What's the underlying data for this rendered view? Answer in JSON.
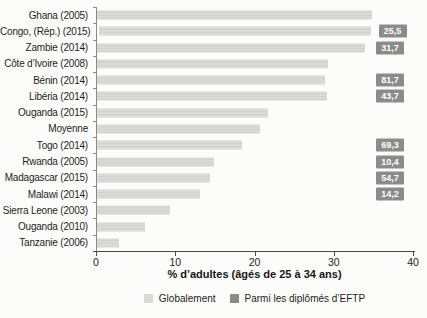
{
  "chart_data": {
    "type": "bar",
    "orientation": "horizontal",
    "title": "",
    "xlabel": "% d’adultes (âgés de 25 à 34 ans)",
    "xlim": [
      0,
      40
    ],
    "xticks": [
      0,
      10,
      20,
      30,
      40
    ],
    "xtick_labels": [
      "0",
      "10",
      "20",
      "30",
      "40"
    ],
    "grid": false,
    "legend_position": "bottom-center",
    "categories": [
      "Ghana (2005)",
      "Congo, (Rép.) (2015)",
      "Zambie (2014)",
      "Côte d’Ivoire (2008)",
      "Bénin (2014)",
      "Libéria (2014)",
      "Ouganda (2015)",
      "Moyenne",
      "Togo (2014)",
      "Rwanda (2005)",
      "Madagascar (2015)",
      "Malawi (2014)",
      "Sierra Leone (2003)",
      "Ouganda (2010)",
      "Tanzanie (2006)"
    ],
    "series": [
      {
        "name": "Globalement",
        "display": "bar",
        "color": "#d9d9d6",
        "values": [
          34.8,
          34.4,
          33.9,
          29.3,
          28.9,
          29.1,
          21.7,
          20.7,
          18.4,
          14.9,
          14.4,
          13.1,
          9.3,
          6.2,
          2.9
        ]
      },
      {
        "name": "Parmi les diplômés d’EFTP",
        "display": "value-badge",
        "color": "#8b8b8b",
        "values": [
          null,
          25.5,
          31.7,
          null,
          81.7,
          43.7,
          null,
          null,
          69.3,
          10.4,
          54.7,
          14.2,
          null,
          null,
          null
        ],
        "labels": [
          null,
          "25,5",
          "31,7",
          null,
          "81,7",
          "43,7",
          null,
          null,
          "69,3",
          "10,4",
          "54,7",
          "14,2",
          null,
          null,
          null
        ]
      }
    ],
    "legend": [
      {
        "label": "Globalement",
        "color": "#d9d9d6"
      },
      {
        "label": "Parmi les diplômés d’EFTP",
        "color": "#8b8b8b"
      }
    ]
  },
  "colors": {
    "background": "#fcfcfa",
    "bar": "#d9d9d6",
    "badge": "#8b8b8b",
    "badge_text": "#ffffff",
    "axis": "#4a4a4a",
    "text": "#1c1c1c"
  }
}
